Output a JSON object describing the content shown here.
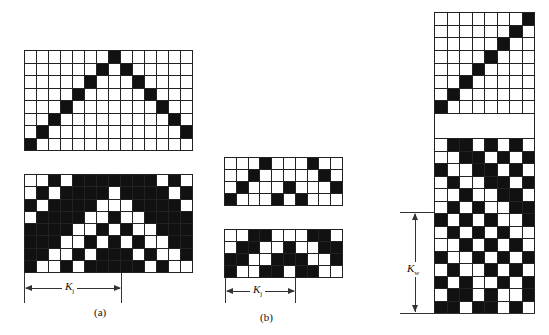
{
  "figure": {
    "panels": [
      {
        "id": "a",
        "caption": "(a)",
        "k_label": "K",
        "k_sub": "j"
      },
      {
        "id": "b",
        "caption": "(b)",
        "k_label": "K",
        "k_sub": "j"
      },
      {
        "id": "c",
        "caption": "",
        "k_label": "K",
        "k_sub": "w"
      }
    ],
    "grids": {
      "a_top": {
        "cols": 14,
        "rows": 8,
        "black": [
          [
            7
          ],
          [
            6,
            8
          ],
          [
            5,
            9
          ],
          [
            4,
            10
          ],
          [
            3,
            11
          ],
          [
            2,
            12
          ],
          [
            1,
            13
          ],
          [
            0
          ]
        ]
      },
      "a_bottom": {
        "cols": 14,
        "rows": 8,
        "white": [
          [
            0,
            1,
            3,
            11,
            13
          ],
          [
            0,
            2,
            7,
            12
          ],
          [
            1,
            6,
            7,
            8,
            13
          ],
          [
            0,
            5,
            6,
            8,
            9
          ],
          [
            4,
            5,
            7,
            9,
            10
          ],
          [
            3,
            4,
            6,
            8,
            10,
            11
          ],
          [
            2,
            3,
            5,
            9,
            11,
            12
          ],
          [
            1,
            2,
            4,
            10,
            12,
            13
          ]
        ]
      },
      "b_top": {
        "cols": 10,
        "rows": 4,
        "black": [
          [
            3,
            7
          ],
          [
            2,
            8
          ],
          [
            1,
            5,
            9
          ],
          [
            0,
            4,
            6
          ]
        ]
      },
      "b_bottom": {
        "cols": 10,
        "rows": 4,
        "white": [
          [
            0,
            1,
            4,
            5,
            6,
            9
          ],
          [
            0,
            3,
            4,
            6,
            7
          ],
          [
            2,
            3,
            7,
            8
          ],
          [
            1,
            2,
            5,
            8,
            9
          ]
        ]
      },
      "c_top": {
        "cols": 8,
        "rows": 8,
        "black": [
          [
            7
          ],
          [
            6
          ],
          [
            5
          ],
          [
            4
          ],
          [
            3
          ],
          [
            2
          ],
          [
            1
          ],
          [
            0
          ]
        ]
      },
      "c_bottom": {
        "cols": 8,
        "rows": 14,
        "white": [
          [
            0,
            3,
            5,
            7
          ],
          [
            0,
            1,
            4,
            6
          ],
          [
            1,
            2,
            5,
            7
          ],
          [
            0,
            2,
            3,
            6
          ],
          [
            0,
            1,
            3,
            4,
            7
          ],
          [
            0,
            2,
            4,
            5
          ],
          [
            1,
            3,
            5,
            6
          ],
          [
            0,
            2,
            4,
            6,
            7
          ],
          [
            0,
            1,
            3,
            5,
            7
          ],
          [
            1,
            2,
            4,
            6
          ],
          [
            0,
            2,
            3,
            5,
            7
          ],
          [
            1,
            3,
            4,
            6
          ],
          [
            0,
            3,
            5,
            6
          ],
          [
            2,
            5,
            7
          ]
        ]
      }
    }
  }
}
